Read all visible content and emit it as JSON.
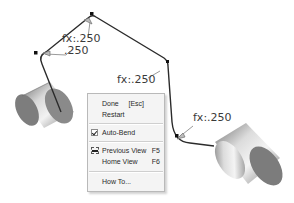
{
  "viewport": {
    "background": "#ffffff",
    "path_color": "#2b2b2b",
    "dimension_color": "#3a3a3a"
  },
  "dimensions": [
    {
      "id": "top-bend-radius",
      "text": "fx:.250"
    },
    {
      "id": "left-bend-radius",
      "text": ".250"
    },
    {
      "id": "center-segment",
      "text": "fx:.250"
    },
    {
      "id": "right-bend-radius",
      "text": "fx:.250"
    }
  ],
  "components": [
    {
      "id": "left-cylinder",
      "type": "cylinder"
    },
    {
      "id": "right-cylinder",
      "type": "cylinder"
    }
  ],
  "context_menu": {
    "items": [
      {
        "label": "Done",
        "mnemonic": "D",
        "shortcut": "[Esc]"
      },
      {
        "label": "Restart",
        "mnemonic": "s",
        "shortcut": ""
      },
      {
        "label": "Auto-Bend",
        "mnemonic": "A",
        "shortcut": "",
        "checked": true
      },
      {
        "label": "Previous View",
        "mnemonic": "",
        "shortcut": "F5",
        "icon": "previous-view-icon"
      },
      {
        "label": "Home View",
        "mnemonic": "",
        "shortcut": "F6"
      },
      {
        "label": "How To...",
        "mnemonic": "H",
        "shortcut": ""
      }
    ]
  }
}
